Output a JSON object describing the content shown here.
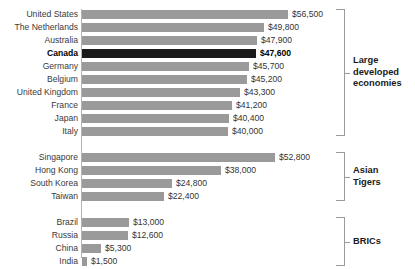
{
  "chart_data": {
    "type": "bar",
    "orientation": "horizontal",
    "title": "",
    "xlabel": "",
    "ylabel": "",
    "xlim": [
      0,
      56500
    ],
    "grid": false,
    "legend": "none",
    "value_prefix": "$",
    "highlight": "Canada",
    "categories": [
      "United States",
      "The Netherlands",
      "Australia",
      "Canada",
      "Germany",
      "Belgium",
      "United Kingdom",
      "France",
      "Japan",
      "Italy",
      "Singapore",
      "Hong Kong",
      "South Korea",
      "Taiwan",
      "Brazil",
      "Russia",
      "China",
      "India"
    ],
    "values": [
      56500,
      49800,
      47900,
      47600,
      45700,
      45200,
      43300,
      41200,
      40400,
      40000,
      52800,
      38000,
      24800,
      22400,
      13000,
      12600,
      5300,
      1500
    ],
    "value_labels": [
      "$56,500",
      "$49,800",
      "$47,900",
      "$47,600",
      "$45,700",
      "$45,200",
      "$43,300",
      "$41,200",
      "$40,400",
      "$40,000",
      "$52,800",
      "$38,000",
      "$24,800",
      "$22,400",
      "$13,000",
      "$12,600",
      "$5,300",
      "$1,500"
    ],
    "groups": [
      {
        "name": "Large developed economies",
        "label_lines": [
          "Large",
          "developed",
          "economies"
        ],
        "members": [
          "United States",
          "The Netherlands",
          "Australia",
          "Canada",
          "Germany",
          "Belgium",
          "United Kingdom",
          "France",
          "Japan",
          "Italy"
        ]
      },
      {
        "name": "Asian Tigers",
        "label_lines": [
          "Asian",
          "Tigers"
        ],
        "members": [
          "Singapore",
          "Hong Kong",
          "South Korea",
          "Taiwan"
        ]
      },
      {
        "name": "BRICs",
        "label_lines": [
          "BRICs"
        ],
        "members": [
          "Brazil",
          "Russia",
          "China",
          "India"
        ]
      }
    ],
    "colors": {
      "bar": "#9a9a9a",
      "bar_highlight": "#1a1a1a",
      "axis": "#b3b3b3",
      "bracket": "#9a9a9a",
      "text": "#333333",
      "background": "#ffffff"
    }
  },
  "rows": [
    {
      "label": "United States",
      "value_label": "$56,500",
      "value": 56500,
      "highlight": false
    },
    {
      "label": "The Netherlands",
      "value_label": "$49,800",
      "value": 49800,
      "highlight": false
    },
    {
      "label": "Australia",
      "value_label": "$47,900",
      "value": 47900,
      "highlight": false
    },
    {
      "label": "Canada",
      "value_label": "$47,600",
      "value": 47600,
      "highlight": true
    },
    {
      "label": "Germany",
      "value_label": "$45,700",
      "value": 45700,
      "highlight": false
    },
    {
      "label": "Belgium",
      "value_label": "$45,200",
      "value": 45200,
      "highlight": false
    },
    {
      "label": "United Kingdom",
      "value_label": "$43,300",
      "value": 43300,
      "highlight": false
    },
    {
      "label": "France",
      "value_label": "$41,200",
      "value": 41200,
      "highlight": false
    },
    {
      "label": "Japan",
      "value_label": "$40,400",
      "value": 40400,
      "highlight": false
    },
    {
      "label": "Italy",
      "value_label": "$40,000",
      "value": 40000,
      "highlight": false
    },
    {
      "label": "Singapore",
      "value_label": "$52,800",
      "value": 52800,
      "highlight": false
    },
    {
      "label": "Hong Kong",
      "value_label": "$38,000",
      "value": 38000,
      "highlight": false
    },
    {
      "label": "South Korea",
      "value_label": "$24,800",
      "value": 24800,
      "highlight": false
    },
    {
      "label": "Taiwan",
      "value_label": "$22,400",
      "value": 22400,
      "highlight": false
    },
    {
      "label": "Brazil",
      "value_label": "$13,000",
      "value": 13000,
      "highlight": false
    },
    {
      "label": "Russia",
      "value_label": "$12,600",
      "value": 12600,
      "highlight": false
    },
    {
      "label": "China",
      "value_label": "$5,300",
      "value": 5300,
      "highlight": false
    },
    {
      "label": "India",
      "value_label": "$1,500",
      "value": 1500,
      "highlight": false
    }
  ],
  "groups": [
    {
      "id": "large-developed-economies",
      "lines": [
        "Large",
        "developed",
        "economies"
      ],
      "first_row": 0,
      "last_row": 9
    },
    {
      "id": "asian-tigers",
      "lines": [
        "Asian",
        "Tigers"
      ],
      "first_row": 10,
      "last_row": 13
    },
    {
      "id": "brics",
      "lines": [
        "BRICs"
      ],
      "first_row": 14,
      "last_row": 17
    }
  ],
  "layout": {
    "bar_origin_x": 82,
    "px_per_dollar": 0.003646,
    "row_pitch": 13,
    "bar_height": 9,
    "group_gaps": [
      0,
      1,
      1
    ],
    "first_row_top": 9
  }
}
